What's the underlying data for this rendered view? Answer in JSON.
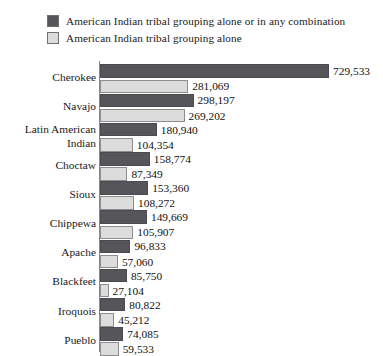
{
  "legend": {
    "entries": [
      {
        "label": "American Indian tribal grouping alone or in any combination",
        "swatch": "dark-swatch",
        "color": "#55555a"
      },
      {
        "label": "American Indian tribal grouping alone",
        "swatch": "light-swatch",
        "color": "#dcdcdc"
      }
    ]
  },
  "colors": {
    "dark": "#55555a",
    "light": "#dcdcdc",
    "axis": "#8a8a8a",
    "text": "#1a1a1a",
    "background": "#ffffff"
  },
  "chart_data": {
    "type": "bar",
    "title": "",
    "subtitle": "",
    "xlabel": "",
    "ylabel": "",
    "orientation": "horizontal",
    "grid": false,
    "legend_position": "top-left",
    "xlim": [
      0,
      729533
    ],
    "categories": [
      "Cherokee",
      "Navajo",
      "Latin American\nIndian",
      "Choctaw",
      "Sioux",
      "Chippewa",
      "Apache",
      "Blackfeet",
      "Iroquois",
      "Pueblo"
    ],
    "series": [
      {
        "name": "American Indian tribal grouping alone or in any combination",
        "color": "#55555a",
        "values": [
          729533,
          298197,
          180940,
          158774,
          153360,
          149669,
          96833,
          85750,
          80822,
          74085
        ],
        "labels": [
          "729,533",
          "298,197",
          "180,940",
          "158,774",
          "153,360",
          "149,669",
          "96,833",
          "85,750",
          "80,822",
          "74,085"
        ]
      },
      {
        "name": "American Indian tribal grouping alone",
        "color": "#dcdcdc",
        "values": [
          281069,
          269202,
          104354,
          87349,
          108272,
          105907,
          57060,
          27104,
          45212,
          59533
        ],
        "labels": [
          "281,069",
          "269,202",
          "104,354",
          "87,349",
          "108,272",
          "105,907",
          "57,060",
          "27,104",
          "45,212",
          "59,533"
        ]
      }
    ]
  }
}
